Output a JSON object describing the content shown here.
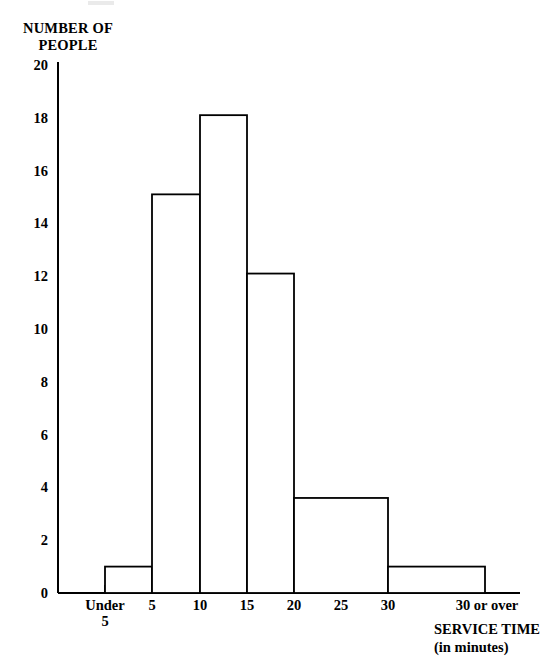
{
  "chart_data": {
    "type": "bar",
    "title": "",
    "subtitle": "",
    "ylabel": "NUMBER OF\nPEOPLE",
    "xlabel": "SERVICE TIME\n(in minutes)",
    "categories": [
      "Under 5",
      "5 to 10",
      "10 to 15",
      "15 to 20",
      "20 to 30",
      "30 or over"
    ],
    "values": [
      1,
      15.1,
      18.1,
      12.1,
      3.6,
      1
    ],
    "bin_edges": [
      0,
      5,
      10,
      15,
      20,
      30,
      40
    ],
    "x_tick_labels": [
      "Under\n5",
      "5",
      "10",
      "15",
      "20",
      "25",
      "30",
      "30 or over"
    ],
    "x_tick_values": [
      2.5,
      5,
      10,
      15,
      20,
      25,
      30,
      35
    ],
    "y_tick_labels": [
      "0",
      "2",
      "4",
      "6",
      "8",
      "10",
      "12",
      "14",
      "16",
      "18",
      "20"
    ],
    "y_tick_values": [
      0,
      2,
      4,
      6,
      8,
      10,
      12,
      14,
      16,
      18,
      20
    ],
    "ylim": [
      0,
      20
    ],
    "xlim": [
      0,
      40
    ],
    "grid": false,
    "legend": false,
    "bar_fill": "#ffffff",
    "bar_stroke": "#000000",
    "axis_color": "#000000",
    "background": "#ffffff"
  },
  "axes": {
    "y_title": "NUMBER OF\nPEOPLE",
    "x_title_line1": "SERVICE TIME",
    "x_title_line2": "(in minutes)"
  },
  "x_ticks": [
    {
      "label": "Under\n5",
      "px": 105
    },
    {
      "label": "5",
      "px": 152
    },
    {
      "label": "10",
      "px": 200
    },
    {
      "label": "15",
      "px": 247
    },
    {
      "label": "20",
      "px": 294
    },
    {
      "label": "25",
      "px": 341
    },
    {
      "label": "30",
      "px": 388
    },
    {
      "label": "30 or over",
      "px": 435
    }
  ],
  "y_ticks": [
    {
      "label": "20",
      "px": 65
    },
    {
      "label": "18",
      "px": 118
    },
    {
      "label": "16",
      "px": 171
    },
    {
      "label": "14",
      "px": 223
    },
    {
      "label": "12",
      "px": 276
    },
    {
      "label": "10",
      "px": 329
    },
    {
      "label": "8",
      "px": 382
    },
    {
      "label": "6",
      "px": 435
    },
    {
      "label": "4",
      "px": 487
    },
    {
      "label": "2",
      "px": 540
    },
    {
      "label": "0",
      "px": 593
    }
  ],
  "bars": [
    {
      "name": "under-5",
      "x0": 58,
      "x1": 105,
      "value": 0,
      "drawn": false
    },
    {
      "name": "bin-u5",
      "x0": 105,
      "x1": 152,
      "value": 1,
      "drawn": true
    },
    {
      "name": "bin-5-10",
      "x0": 152,
      "x1": 200,
      "value": 15.1,
      "drawn": true
    },
    {
      "name": "bin-10-15",
      "x0": 200,
      "x1": 247,
      "value": 18.1,
      "drawn": true
    },
    {
      "name": "bin-15-20",
      "x0": 247,
      "x1": 294,
      "value": 12.1,
      "drawn": true
    },
    {
      "name": "bin-20-30",
      "x0": 294,
      "x1": 388,
      "value": 3.6,
      "drawn": true
    },
    {
      "name": "bin-30-over",
      "x0": 388,
      "x1": 485,
      "value": 1,
      "drawn": true
    }
  ]
}
